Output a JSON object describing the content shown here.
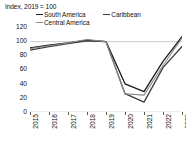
{
  "chart_data": {
    "type": "line",
    "title": "Index, 2019 = 100",
    "xlabel": "",
    "ylabel": "",
    "categories": [
      "2015",
      "2016",
      "2017",
      "2018",
      "2019",
      "2020",
      "2021",
      "2022",
      "2023"
    ],
    "x": [
      2015,
      2016,
      2017,
      2018,
      2019,
      2020,
      2021,
      2022,
      2023
    ],
    "ylim": [
      0,
      125
    ],
    "xlim": [
      2015,
      2023
    ],
    "yticks": [
      0,
      20,
      40,
      60,
      80,
      100,
      120
    ],
    "ytick_labels": [
      "0",
      "20",
      "40",
      "60",
      "80",
      "100",
      "120"
    ],
    "grid": false,
    "reference_line": 100,
    "legend_position": "top",
    "series": [
      {
        "name": "South America",
        "color": "#1a1a1a",
        "values": [
          91,
          95,
          98,
          102,
          100,
          40,
          29,
          72,
          107
        ]
      },
      {
        "name": "Caribbean",
        "color": "#3d3d3d",
        "values": [
          88,
          93,
          97,
          101,
          100,
          26,
          14,
          63,
          93
        ]
      },
      {
        "name": "Central America",
        "color": "#8a8a8a",
        "values": [
          90,
          94,
          98,
          103,
          100,
          26,
          24,
          66,
          105
        ]
      }
    ]
  },
  "axis": {
    "title": "Index, 2019 = 100"
  },
  "legend": {
    "rows": [
      [
        {
          "label": "South America",
          "color": "#1a1a1a"
        },
        {
          "label": "Caribbean",
          "color": "#3d3d3d"
        }
      ],
      [
        {
          "label": "Central America",
          "color": "#8a8a8a"
        }
      ]
    ]
  }
}
